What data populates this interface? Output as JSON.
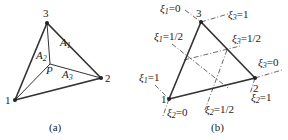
{
  "panel_a": {
    "caption": "(a)",
    "vertices": [
      {
        "id": "1",
        "label": "1",
        "x": 15,
        "y": 100
      },
      {
        "id": "2",
        "label": "2",
        "x": 101,
        "y": 78
      },
      {
        "id": "3",
        "label": "3",
        "x": 47,
        "y": 23
      }
    ],
    "interior_point": {
      "label": "P",
      "x": 50,
      "y": 64
    },
    "areas": [
      {
        "name": "A",
        "sub": "1"
      },
      {
        "name": "A",
        "sub": "2"
      },
      {
        "name": "A",
        "sub": "3"
      }
    ]
  },
  "panel_b": {
    "caption": "(b)",
    "vertices": [
      {
        "id": "1",
        "label": "1",
        "x": 169,
        "y": 99
      },
      {
        "id": "2",
        "label": "2",
        "x": 255,
        "y": 78
      },
      {
        "id": "3",
        "label": "3",
        "x": 201,
        "y": 22
      }
    ],
    "symbol": "ξ",
    "coordinate_lines": [
      {
        "sub": "1",
        "value": "=0"
      },
      {
        "sub": "1",
        "value": "=1/2"
      },
      {
        "sub": "1",
        "value": "=1"
      },
      {
        "sub": "2",
        "value": "=0"
      },
      {
        "sub": "2",
        "value": "=1/2"
      },
      {
        "sub": "2",
        "value": "=1"
      },
      {
        "sub": "3",
        "value": "=0"
      },
      {
        "sub": "3",
        "value": "=1/2"
      },
      {
        "sub": "3",
        "value": "=1"
      }
    ]
  }
}
